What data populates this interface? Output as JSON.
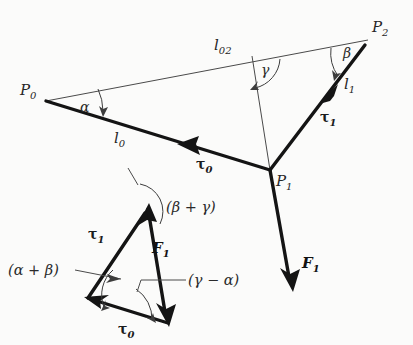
{
  "figure": {
    "background_color": "#fbfbfa",
    "line_color": "#141414",
    "thin_line_color": "#4a4a4a",
    "width": 413,
    "height": 345
  },
  "points": {
    "p0": {
      "label": "P",
      "sub": "0",
      "x": 46,
      "y": 101,
      "text_x": 20,
      "text_y": 95
    },
    "p1": {
      "label": "P",
      "sub": "1",
      "x": 270,
      "y": 170,
      "text_x": 276,
      "text_y": 186
    },
    "p2": {
      "label": "P",
      "sub": "2",
      "x": 368,
      "y": 40,
      "text_x": 372,
      "text_y": 32
    }
  },
  "segments": {
    "l0": {
      "label": "l",
      "sub": "0",
      "text_x": 114,
      "text_y": 143,
      "from": "p0",
      "to": "p1"
    },
    "l1": {
      "label": "l",
      "sub": "1",
      "text_x": 344,
      "text_y": 89,
      "from": "p1",
      "to": "p2"
    },
    "l02": {
      "label": "l",
      "sub": "02",
      "text_x": 214,
      "text_y": 50,
      "from": "p0",
      "to": "p2"
    }
  },
  "angles": {
    "alpha": {
      "label": "α",
      "text_x": 80,
      "text_y": 112,
      "at": "p0"
    },
    "beta": {
      "label": "β",
      "text_x": 343,
      "text_y": 58,
      "at": "p2"
    },
    "gamma": {
      "label": "γ",
      "text_x": 261,
      "text_y": 75,
      "at": "l02"
    }
  },
  "torques": {
    "tau0_main": {
      "label": "τ",
      "sub": "0",
      "text_x": 196,
      "text_y": 169
    },
    "tau1_main": {
      "label": "τ",
      "sub": "1",
      "text_x": 320,
      "text_y": 122
    },
    "tau1_tri": {
      "label": "τ",
      "sub": "1",
      "text_x": 88,
      "text_y": 239
    },
    "tau0_tri": {
      "label": "τ",
      "sub": "0",
      "text_x": 118,
      "text_y": 334
    }
  },
  "forces": {
    "f1_main": {
      "label": "F",
      "sub": "1",
      "text_x": 302,
      "text_y": 268
    },
    "f1_tri": {
      "label": "F",
      "sub": "1",
      "text_x": 152,
      "text_y": 253
    }
  },
  "composite_angles": {
    "beta_plus_gamma": {
      "label": "(β + γ)",
      "text_x": 166,
      "text_y": 212
    },
    "alpha_plus_beta": {
      "label": "(α + β)",
      "text_x": 8,
      "text_y": 275
    },
    "gamma_minus_alpha": {
      "label": "(γ − α)",
      "text_x": 188,
      "text_y": 285
    }
  },
  "force_triangle": {
    "apex": {
      "x": 148,
      "y": 208
    },
    "left": {
      "x": 88,
      "y": 298
    },
    "bottom": {
      "x": 168,
      "y": 323
    }
  }
}
